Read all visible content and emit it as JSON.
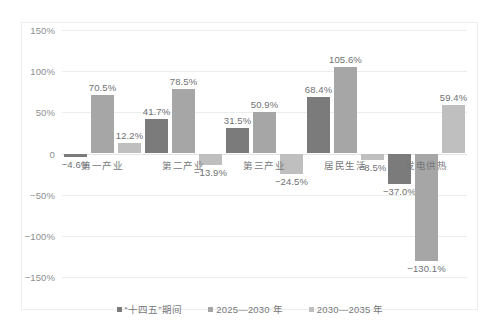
{
  "chart_data": {
    "type": "bar",
    "title": "",
    "subtitle": "",
    "xlabel": "",
    "ylabel": "",
    "categories": [
      "第一产业",
      "第二产业",
      "第三产业",
      "居民生活",
      "发电供热"
    ],
    "series": [
      {
        "name": "“十四五”期间",
        "color": "#7b7b7b",
        "values": [
          -4.6,
          41.7,
          31.5,
          68.4,
          -37.0
        ],
        "labels": [
          "−4.6%",
          "41.7%",
          "31.5%",
          "68.4%",
          "−37.0%"
        ]
      },
      {
        "name": "2025—2030 年",
        "color": "#a6a6a6",
        "values": [
          70.5,
          78.5,
          50.9,
          105.6,
          -130.1
        ],
        "labels": [
          "70.5%",
          "78.5%",
          "50.9%",
          "105.6%",
          "−130.1%"
        ]
      },
      {
        "name": "2030—2035 年",
        "color": "#bfbfbf",
        "values": [
          12.2,
          -13.9,
          -24.5,
          -8.5,
          59.4
        ],
        "labels": [
          "12.2%",
          "−13.9%",
          "−24.5%",
          "−8.5%",
          "59.4%"
        ]
      }
    ],
    "ylim": [
      -150,
      150
    ],
    "yticks": [
      150,
      100,
      50,
      0,
      -50,
      -100,
      -150
    ],
    "ytick_labels": [
      "150%",
      "100%",
      "50%",
      "0",
      "−50%",
      "−100%",
      "−150%"
    ],
    "grid": true,
    "legend_position": "bottom",
    "value_labels": true,
    "units": "percent"
  },
  "legend": {
    "items": [
      {
        "label": "“十四五”期间",
        "color": "#7b7b7b"
      },
      {
        "label": "2025—2030 年",
        "color": "#a6a6a6"
      },
      {
        "label": "2030—2035 年",
        "color": "#bfbfbf"
      }
    ]
  }
}
